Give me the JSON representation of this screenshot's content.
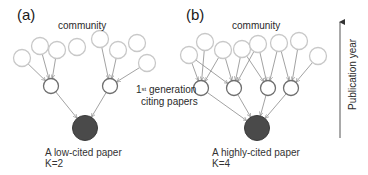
{
  "panels": {
    "a": {
      "tag": "(a)",
      "community_label": "community",
      "caption_line1": "A low-cited paper",
      "caption_line2": "K=2",
      "top_nodes": [
        [
          22,
          58
        ],
        [
          40,
          46
        ],
        [
          57,
          50
        ],
        [
          77,
          47
        ],
        [
          100,
          39
        ],
        [
          118,
          50
        ],
        [
          137,
          43
        ],
        [
          147,
          63
        ]
      ],
      "middle_nodes": [
        [
          51,
          86
        ],
        [
          110,
          86
        ]
      ],
      "target_node": [
        85,
        128
      ],
      "edges_top_to_middle": [
        [
          0,
          0
        ],
        [
          1,
          0
        ],
        [
          2,
          0
        ],
        [
          4,
          1
        ],
        [
          5,
          1
        ],
        [
          7,
          1
        ]
      ]
    },
    "b": {
      "tag": "(b)",
      "community_label": "community",
      "caption_line1": "A highly-cited paper",
      "caption_line2": "K=4",
      "top_nodes": [
        [
          189,
          55
        ],
        [
          205,
          42
        ],
        [
          223,
          50
        ],
        [
          242,
          49
        ],
        [
          258,
          44
        ],
        [
          279,
          43
        ],
        [
          299,
          41
        ],
        [
          318,
          56
        ]
      ],
      "middle_nodes": [
        [
          201,
          88
        ],
        [
          234,
          88
        ],
        [
          268,
          88
        ],
        [
          291,
          88
        ]
      ],
      "target_node": [
        257,
        128
      ],
      "edges_top_to_middle": [
        [
          0,
          0
        ],
        [
          0,
          1
        ],
        [
          1,
          0
        ],
        [
          2,
          0
        ],
        [
          2,
          1
        ],
        [
          3,
          1
        ],
        [
          3,
          2
        ],
        [
          4,
          1
        ],
        [
          4,
          2
        ],
        [
          5,
          2
        ],
        [
          5,
          3
        ],
        [
          6,
          3
        ],
        [
          7,
          3
        ]
      ]
    }
  },
  "shared_label": {
    "line1_prefix": "1",
    "line1_sup": "st",
    "line1_suffix": " generation",
    "line2": "citing papers"
  },
  "axis": {
    "label": "Publication year",
    "direction": "up"
  },
  "colors": {
    "community_node_stroke": "#c8c8c8",
    "citing_node_stroke": "#6e6e6e",
    "target_node_fill": "#4a4a4a",
    "edge_stroke": "#8a8a8a",
    "axis_stroke": "#555555"
  }
}
